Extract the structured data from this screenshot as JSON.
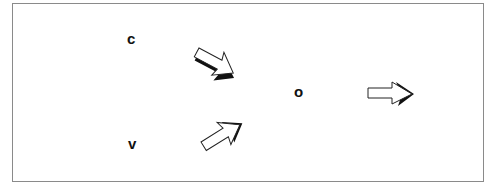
{
  "diagram": {
    "nodes": [
      {
        "id": "c",
        "label": "c"
      },
      {
        "id": "v",
        "label": "v"
      },
      {
        "id": "o",
        "label": "o"
      }
    ],
    "edges": [
      {
        "from": "c",
        "to": "o",
        "style": "block-arrow"
      },
      {
        "from": "v",
        "to": "o",
        "style": "block-arrow"
      },
      {
        "from": "o",
        "to": "output",
        "style": "block-arrow"
      }
    ]
  }
}
